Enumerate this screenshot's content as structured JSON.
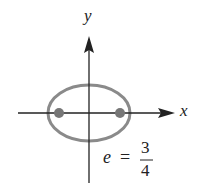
{
  "diagram": {
    "axes": {
      "x_label": "x",
      "y_label": "y"
    },
    "ellipse": {
      "center": [
        89,
        113
      ],
      "rx": 41,
      "ry": 28,
      "stroke_color": "#8a8a8a",
      "foci": [
        [
          59,
          113
        ],
        [
          120,
          113
        ]
      ],
      "focus_color": "#777777"
    },
    "annotation": {
      "variable": "e",
      "equals": "=",
      "numerator": "3",
      "denominator": "4"
    },
    "colors": {
      "axis": "#222222",
      "background": "#ffffff"
    }
  }
}
